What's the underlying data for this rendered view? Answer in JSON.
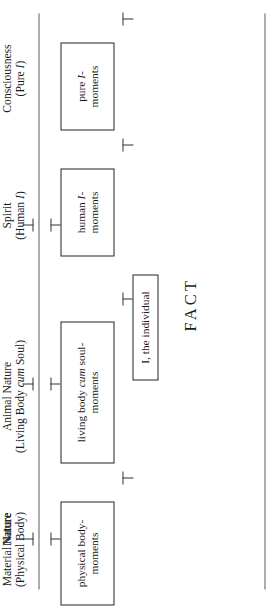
{
  "figure": {
    "orientation": "rotated-90-ccw",
    "caption_word": "FACT",
    "axes": [
      {
        "name": "upper-axis",
        "note": "long horizontal rule above the boxes"
      },
      {
        "name": "lower-axis",
        "note": "long horizontal rule below the boxes"
      }
    ],
    "scale_labels": [
      {
        "id": "material-nature",
        "line1": "Material Nature",
        "line2": "(Physical Body)"
      },
      {
        "id": "animal-nature",
        "line1": "Animal Nature",
        "line2": "(Living Body cum Soul)",
        "line2_italic_word": "cum"
      },
      {
        "id": "spirit",
        "line1": "Spirit",
        "line2": "(Human I)",
        "line2_italic_word": "I"
      },
      {
        "id": "consciousness",
        "line1": "Consciousness",
        "line2": "(Pure I)",
        "line2_italic_word": "I"
      }
    ],
    "group_label": {
      "id": "nature",
      "text": "Nature"
    },
    "boxes": [
      {
        "id": "physical-body-moments",
        "line1": "physical body-",
        "line2": "moments"
      },
      {
        "id": "living-body-cum-soul-moments",
        "line1": "living body cum soul-",
        "line2": "moments",
        "italic_word": "cum"
      },
      {
        "id": "human-i-moments",
        "line1": "human I-",
        "line2": "moments",
        "italic_word": "I"
      },
      {
        "id": "pure-i-moments",
        "line1": "pure I-",
        "line2": "moments",
        "italic_word": "I"
      }
    ],
    "bracket_box": {
      "id": "i-the-individual",
      "text": "I, the individual"
    },
    "tick_count_top_row": 3,
    "tick_count_box_row": 4,
    "tick_count_lower_row": 4,
    "colors": {
      "ink": "#1a1a1a",
      "rule": "#5a5a5a",
      "box_border": "#222222",
      "background": "#ffffff"
    }
  }
}
